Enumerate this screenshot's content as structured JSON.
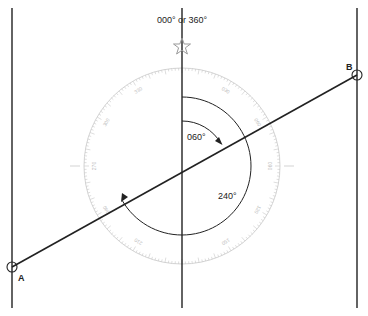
{
  "diagram": {
    "north_label": "000° or 360°",
    "point_a_label": "A",
    "point_b_label": "B",
    "angle_1_label": "060°",
    "angle_2_label": "240°",
    "compass_rose": {
      "labels": [
        "000",
        "030",
        "060",
        "090",
        "120",
        "150",
        "180",
        "210",
        "240",
        "270",
        "300",
        "330"
      ],
      "tick_color": "#c8c8c8"
    },
    "colors": {
      "line": "#222222",
      "rose": "#c8c8c8",
      "star": "#999999"
    },
    "icons": {
      "north_star": "star-icon"
    }
  }
}
